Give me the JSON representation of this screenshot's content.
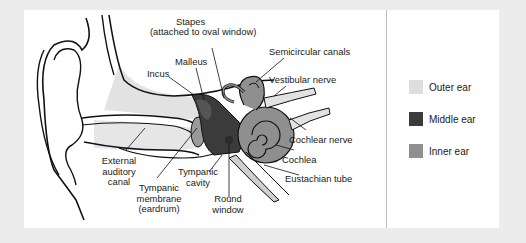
{
  "figure": {
    "labels": {
      "stapes": "Stapes",
      "stapes_note": "(attached to oval window)",
      "semicircular_canals": "Semicircular canals",
      "malleus": "Malleus",
      "incus": "Incus",
      "vestibular_nerve": "Vestibular nerve",
      "cochlear_nerve": "Cochlear nerve",
      "cochlea": "Cochlea",
      "eustachian_tube": "Eustachian tube",
      "external_auditory_canal_1": "External",
      "external_auditory_canal_2": "auditory",
      "external_auditory_canal_3": "canal",
      "tympanic_membrane_1": "Tympanic",
      "tympanic_membrane_2": "membrane",
      "tympanic_membrane_3": "(eardrum)",
      "tympanic_cavity_1": "Tympanic",
      "tympanic_cavity_2": "cavity",
      "round_window_1": "Round",
      "round_window_2": "window"
    }
  },
  "legend": {
    "items": [
      {
        "label": "Outer ear",
        "color": "#dedede"
      },
      {
        "label": "Middle ear",
        "color": "#3b3b3b"
      },
      {
        "label": "Inner ear",
        "color": "#8f8f8f"
      }
    ]
  },
  "colors": {
    "background": "#ececec",
    "panel": "#ffffff",
    "outer_ear": "#dedede",
    "middle_ear": "#3b3b3b",
    "inner_ear": "#8f8f8f",
    "line": "#111111"
  }
}
